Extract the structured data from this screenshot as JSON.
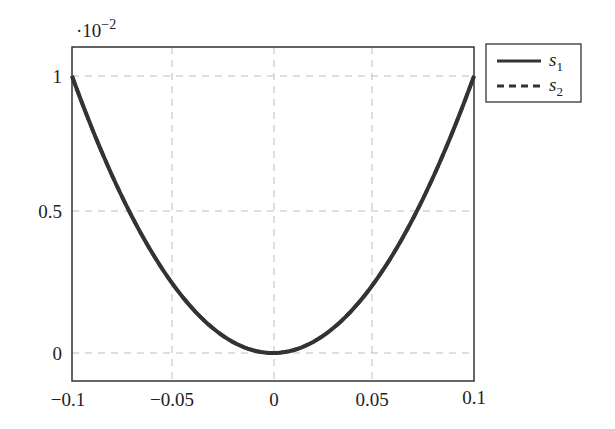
{
  "chart_data": {
    "type": "line",
    "title": "",
    "xlabel": "",
    "ylabel": "",
    "y_scale_label": "·10⁻²",
    "y_scale_base": "·10",
    "y_scale_exp": "−2",
    "xlim": [
      -0.1,
      0.1
    ],
    "ylim": [
      -0.0025,
      0.011
    ],
    "grid": true,
    "x_ticks": [
      -0.1,
      -0.05,
      0,
      0.05,
      0.1
    ],
    "x_tick_labels": [
      "−0.1",
      "−0.05",
      "0",
      "0.05",
      "0.1"
    ],
    "y_ticks": [
      0,
      0.5,
      1
    ],
    "y_tick_labels": [
      "0",
      "0.5",
      "1"
    ],
    "legend_position": "outside-right-top",
    "series": [
      {
        "name": "s1",
        "label_base": "s",
        "label_sub": "1",
        "style": "solid",
        "color": "#333333",
        "x": [
          -0.1,
          -0.075,
          -0.05,
          -0.025,
          0,
          0.025,
          0.05,
          0.075,
          0.1
        ],
        "y": [
          0.01,
          0.005625,
          0.0025,
          0.000625,
          0,
          0.000625,
          0.0025,
          0.005625,
          0.01
        ]
      },
      {
        "name": "s2",
        "label_base": "s",
        "label_sub": "2",
        "style": "dashed",
        "color": "#333333",
        "x": [
          -0.1,
          -0.075,
          -0.05,
          -0.025,
          0,
          0.025,
          0.05,
          0.075,
          0.1
        ],
        "y": [
          0.01,
          0.005625,
          0.0025,
          0.000625,
          0,
          0.000625,
          0.0025,
          0.005625,
          0.01
        ]
      }
    ]
  }
}
